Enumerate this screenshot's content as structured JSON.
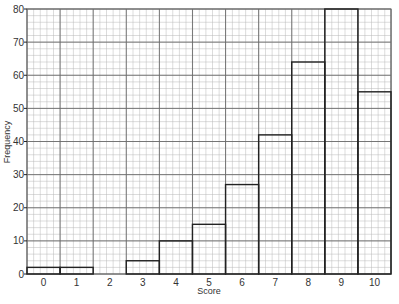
{
  "chart_data": {
    "type": "bar",
    "title": "",
    "xlabel": "Score",
    "ylabel": "Frequency",
    "categories": [
      "0",
      "1",
      "2",
      "3",
      "4",
      "5",
      "6",
      "7",
      "8",
      "9",
      "10"
    ],
    "values": [
      2,
      2,
      0,
      4,
      10,
      15,
      27,
      42,
      64,
      80,
      55
    ],
    "ylim": [
      0,
      80
    ],
    "yticks": [
      0,
      10,
      20,
      30,
      40,
      50,
      60,
      70,
      80
    ],
    "ytick_labels": [
      "0",
      "10",
      "20",
      "30",
      "40",
      "50",
      "60",
      "70",
      "80"
    ],
    "grid": true,
    "grid_minor_step": 2,
    "legend": "none",
    "style": "histogram on graph paper",
    "colors": {
      "grid_minor": "#b8b8b8",
      "grid_major": "#6a6a6a",
      "bar_outline": "#222222",
      "text": "#333333"
    }
  }
}
